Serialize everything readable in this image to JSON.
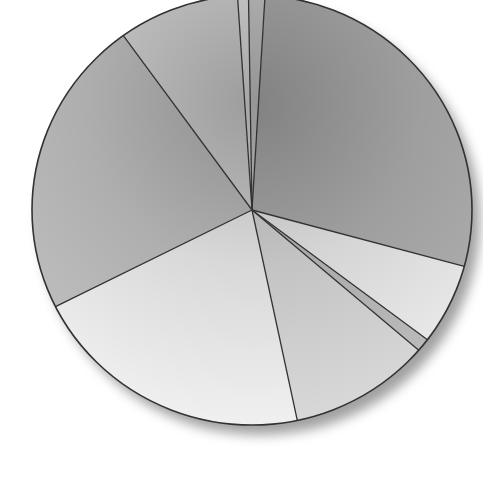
{
  "chart_data": {
    "type": "pie",
    "title": "",
    "legend": "none",
    "labels": [
      "",
      "",
      "",
      "",
      "",
      "",
      "",
      "",
      ""
    ],
    "values": [
      28.3,
      6.1,
      1.0,
      10.4,
      20.9,
      22.5,
      8.9,
      0.8,
      1.2
    ],
    "start_angle_deg": 273.4,
    "direction": "clockwise",
    "center": [
      252,
      210
    ],
    "radius": [
      220,
      215
    ],
    "slice_colors": [
      "#b4b4b4",
      "#f2f2f2",
      "#c2c2c2",
      "#dedede",
      "#f6f6f6",
      "#c6c6c6",
      "#dadada",
      "#e8e8e8",
      "#cfcfcf"
    ],
    "stroke_color": "#333333",
    "shadow": true
  }
}
